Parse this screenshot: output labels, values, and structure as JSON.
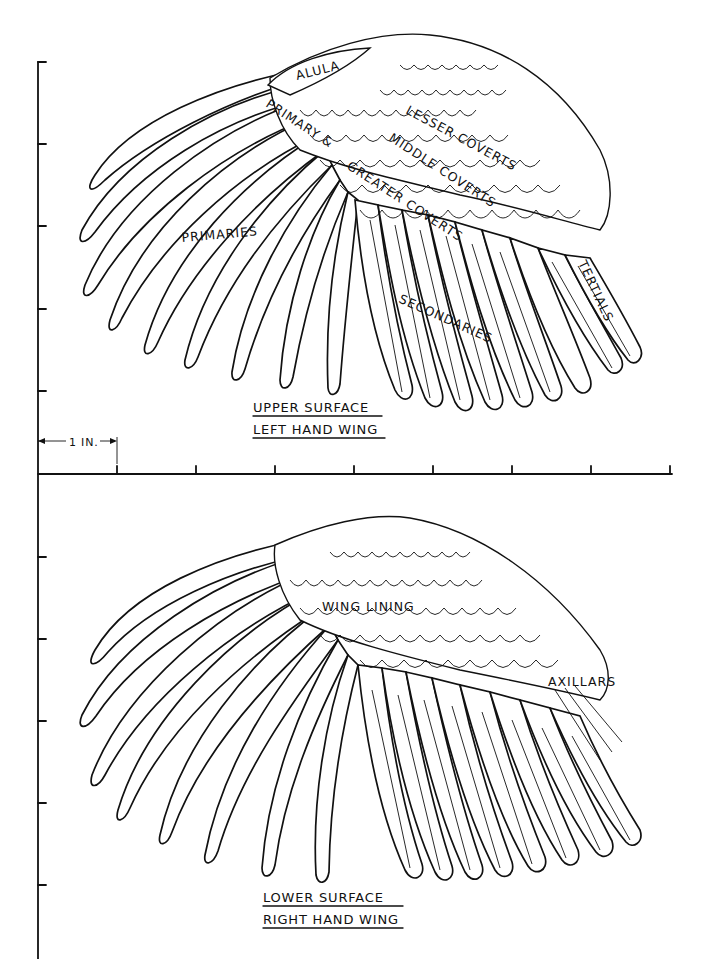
{
  "figure": {
    "panels": [
      {
        "id": "upper",
        "caption_line1": "UPPER SURFACE",
        "caption_line2": "LEFT HAND WING",
        "labels": {
          "alula": "ALULA",
          "primary_greater_coverts_1": "PRIMARY &",
          "primary_greater_coverts_2": "GREATER COVERTS",
          "lesser_coverts": "LESSER COVERTS",
          "middle_coverts": "MIDDLE COVERTS",
          "primaries": "PRIMARIES",
          "secondaries": "SECONDARIES",
          "tertials": "TERTIALS"
        }
      },
      {
        "id": "lower",
        "caption_line1": "LOWER SURFACE",
        "caption_line2": "RIGHT HAND WING",
        "labels": {
          "wing_lining": "WING LINING",
          "axillars": "AXILLARS"
        }
      }
    ],
    "scale": {
      "label": "1 IN.",
      "unit": "inch",
      "x_ticks": 8,
      "y_ticks_upper": 5,
      "y_ticks_lower": 5
    },
    "colors": {
      "ink": "#111111",
      "paper": "#ffffff"
    }
  }
}
